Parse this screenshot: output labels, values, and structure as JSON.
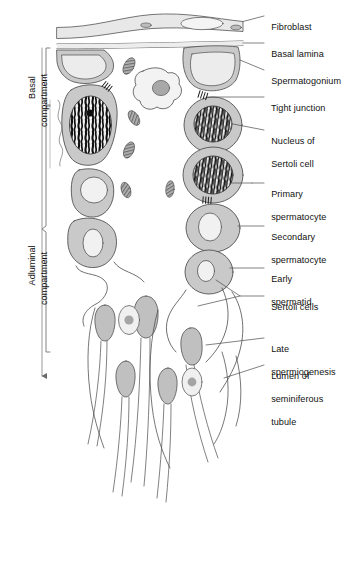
{
  "figure": {
    "title_alt": "Seminiferous epithelium / spermatogenesis diagram",
    "background_color": "#ffffff",
    "line_color": "#4a4a4a",
    "text_color": "#111111",
    "cell_fill": "#c9c9c9",
    "cell_fill_light": "#e2e2e2",
    "nucleus_fill": "#efefef",
    "chromatin_color": "#111111",
    "mitochondria_fill": "#9a9a9a"
  },
  "compartments": [
    {
      "id": "basal",
      "label_line1": "Basal",
      "label_line2": "compartment"
    },
    {
      "id": "adluminal",
      "label_line1": "Adluminal",
      "label_line2": "compartment"
    }
  ],
  "callouts": [
    {
      "id": "fibroblast",
      "line1": "Fibroblast",
      "line2": "",
      "line3": ""
    },
    {
      "id": "basal-lamina",
      "line1": "Basal lamina",
      "line2": "",
      "line3": ""
    },
    {
      "id": "spermatogonium",
      "line1": "Spermatogonium",
      "line2": "",
      "line3": ""
    },
    {
      "id": "tight-junction",
      "line1": "Tight junction",
      "line2": "",
      "line3": ""
    },
    {
      "id": "nucleus-sertoli",
      "line1": "Nucleus of",
      "line2": "Sertoli cell",
      "line3": ""
    },
    {
      "id": "primary-spermatocyte",
      "line1": "Primary",
      "line2": "spermatocyte",
      "line3": ""
    },
    {
      "id": "secondary-spermatocyte",
      "line1": "Secondary",
      "line2": "spermatocyte",
      "line3": ""
    },
    {
      "id": "early-spermatid",
      "line1": "Early",
      "line2": "spermatid",
      "line3": ""
    },
    {
      "id": "sertoli-cells",
      "line1": "Sertoli cells",
      "line2": "",
      "line3": ""
    },
    {
      "id": "late-spermiogenesis",
      "line1": "Late",
      "line2": "spermiogenesis",
      "line3": ""
    },
    {
      "id": "lumen",
      "line1": "Lumen of",
      "line2": "seminiferous",
      "line3": "tubule"
    }
  ]
}
